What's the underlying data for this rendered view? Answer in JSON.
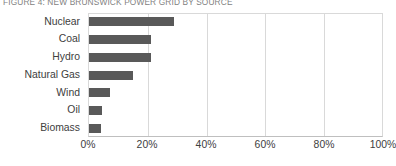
{
  "chart_data": {
    "type": "bar",
    "orientation": "horizontal",
    "title": "FIGURE 4: NEW BRUNSWICK POWER GRID BY SOURCE",
    "xlabel": "",
    "ylabel": "",
    "categories": [
      "Nuclear",
      "Coal",
      "Hydro",
      "Natural Gas",
      "Wind",
      "Oil",
      "Biomass"
    ],
    "values": [
      29,
      21,
      21,
      15,
      7,
      4.5,
      4
    ],
    "value_unit": "%",
    "xlim": [
      0,
      100
    ],
    "xticks": [
      0,
      20,
      40,
      60,
      80,
      100
    ],
    "xtick_labels": [
      "0%",
      "20%",
      "40%",
      "60%",
      "80%",
      "100%"
    ],
    "grid": "vertical",
    "legend": "none",
    "bar_color": "#595959",
    "gridline_color": "#d9d9d9",
    "axis_color": "#bfbfbf",
    "title_color": "#7f7f7f",
    "label_color": "#404040"
  }
}
